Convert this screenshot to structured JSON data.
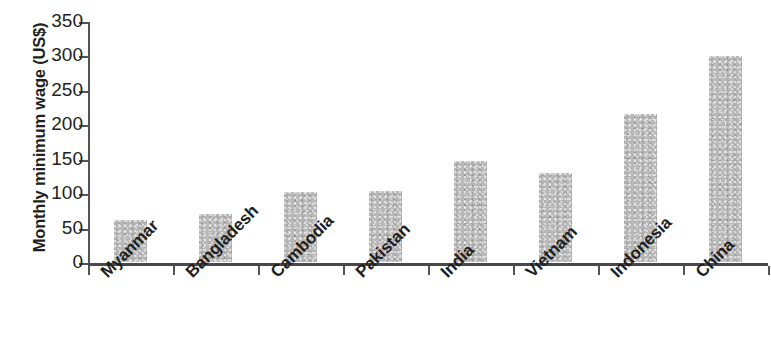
{
  "chart_data": {
    "type": "bar",
    "title": "",
    "subtitle": "",
    "xlabel": "",
    "ylabel": "Monthly minimum wage (US$)",
    "categories": [
      "Myanmar",
      "Bangladesh",
      "Cambodia",
      "Pakistan",
      "India",
      "Vietnam",
      "Indonesia",
      "China"
    ],
    "values": [
      61,
      70,
      102,
      103,
      147,
      130,
      215,
      299
    ],
    "ylim": [
      0,
      350
    ],
    "ytick_values": [
      0,
      50,
      100,
      150,
      200,
      250,
      300,
      350
    ],
    "ytick_labels": [
      "0",
      "50",
      "100",
      "150",
      "200",
      "250",
      "300",
      "350"
    ],
    "grid": false,
    "legend": null,
    "legend_position": "none",
    "bar_color": "#b9b9b9",
    "axis_color": "#4a484a",
    "text_color": "#231f20",
    "background_color": "#ffffff",
    "annotations": []
  }
}
